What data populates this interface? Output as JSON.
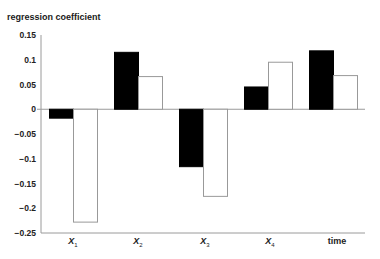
{
  "chart_data": {
    "type": "bar",
    "title": "",
    "ylabel": "regression coefficient",
    "xlabel": "",
    "categories": [
      "X1",
      "X2",
      "X3",
      "X4",
      "time"
    ],
    "category_display": [
      {
        "base": "X",
        "sub": "1"
      },
      {
        "base": "X",
        "sub": "2"
      },
      {
        "base": "X",
        "sub": "3"
      },
      {
        "base": "X",
        "sub": "4"
      },
      {
        "base": "time",
        "sub": ""
      }
    ],
    "series": [
      {
        "name": "series 1 (black)",
        "color": "#000000",
        "values": [
          -0.018,
          0.115,
          -0.116,
          0.045,
          0.118
        ]
      },
      {
        "name": "series 2 (white)",
        "color": "#ffffff",
        "values": [
          -0.228,
          0.066,
          -0.176,
          0.095,
          0.068
        ]
      }
    ],
    "ylim": [
      -0.25,
      0.15
    ],
    "yticks": [
      "0.15",
      "0.1",
      "0.05",
      "0",
      "-0.05",
      "-0.1",
      "-0.15",
      "-0.2",
      "-0.25"
    ],
    "ytick_values": [
      0.15,
      0.1,
      0.05,
      0,
      -0.05,
      -0.1,
      -0.15,
      -0.2,
      -0.25
    ],
    "grid": false,
    "legend": "none"
  }
}
